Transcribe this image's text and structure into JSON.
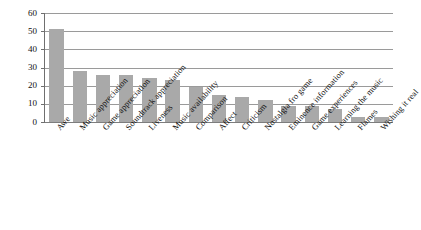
{
  "chart_data": {
    "type": "bar",
    "title": "",
    "subtitle": "",
    "xlabel": "",
    "ylabel": "",
    "ylim": [
      0,
      60
    ],
    "yticks": [
      0,
      10,
      20,
      30,
      40,
      50,
      60
    ],
    "ytick_labels": [
      "0",
      "10",
      "20",
      "30",
      "40",
      "50",
      "60"
    ],
    "grid": true,
    "legend": false,
    "legend_position": "none",
    "orientation": "vertical",
    "bar_color": "#a9a9a9",
    "categories": [
      "Awe",
      "Music appreciation",
      "Game appreciation",
      "Soundtrack appreciation",
      "Liveness",
      "Music availability",
      "Comparison",
      "Affect",
      "Criticism",
      "Nostalgia fro game",
      "Eminence information",
      "Game experiences",
      "Learning the music",
      "Flames",
      "Wishing it real"
    ],
    "values": [
      51,
      28,
      26,
      26,
      24,
      23,
      19,
      15,
      14,
      12,
      9,
      9,
      7,
      3,
      3
    ]
  },
  "colors": {
    "bar": "#a9a9a9",
    "gridline": "#9a9a9a",
    "axis": "#6f6f6f",
    "text": "#101010",
    "background": "#ffffff"
  }
}
